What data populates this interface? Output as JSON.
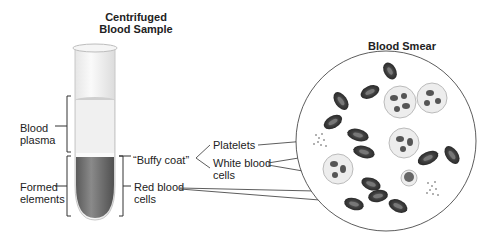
{
  "titles": {
    "sample": "Centrifuged\nBlood Sample",
    "smear": "Blood Smear"
  },
  "labels": {
    "plasma": "Blood\nplasma",
    "formed": "Formed\nelements",
    "buffy": "“Buffy coat”",
    "platelets": "Platelets",
    "wbc": "White blood\ncells",
    "rbc": "Red blood\ncells"
  },
  "colors": {
    "rbc": "#4a4a4a",
    "wbc_fill": "#ececec",
    "tube_plasma": "#f2f2f2",
    "tube_rbc": "#6a6a6a",
    "line": "#333333"
  }
}
